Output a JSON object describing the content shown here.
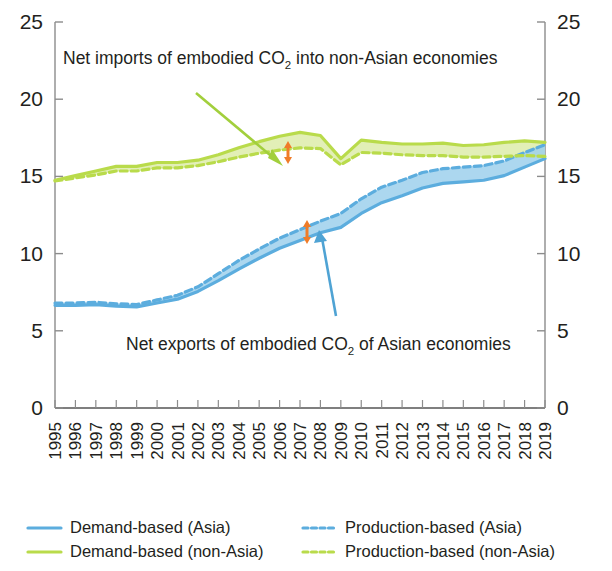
{
  "chart_data": {
    "type": "line",
    "title": "",
    "subtitle": "",
    "xlabel": "",
    "ylabel": "",
    "ylim": [
      0,
      25
    ],
    "yticks": [
      0,
      5,
      10,
      15,
      20,
      25
    ],
    "dual_y_axis": true,
    "grid": false,
    "legend_position": "bottom",
    "categories": [
      "1995",
      "1996",
      "1997",
      "1998",
      "1999",
      "2000",
      "2001",
      "2002",
      "2003",
      "2004",
      "2005",
      "2006",
      "2007",
      "2008",
      "2009",
      "2010",
      "2011",
      "2012",
      "2013",
      "2014",
      "2015",
      "2016",
      "2017",
      "2018",
      "2019"
    ],
    "series": [
      {
        "name": "Demand-based (Asia)",
        "style": "solid",
        "color": "#5cadde",
        "values": [
          6.65,
          6.65,
          6.7,
          6.6,
          6.55,
          6.8,
          7.05,
          7.55,
          8.25,
          9.0,
          9.7,
          10.35,
          10.85,
          11.35,
          11.7,
          12.6,
          13.3,
          13.75,
          14.25,
          14.55,
          14.65,
          14.75,
          15.05,
          15.6,
          16.15
        ]
      },
      {
        "name": "Production-based (Asia)",
        "style": "dashed",
        "color": "#5cadde",
        "values": [
          6.8,
          6.8,
          6.85,
          6.75,
          6.7,
          7.0,
          7.3,
          7.85,
          8.7,
          9.55,
          10.3,
          11.0,
          11.55,
          12.1,
          12.6,
          13.55,
          14.3,
          14.75,
          15.25,
          15.5,
          15.6,
          15.7,
          16.0,
          16.55,
          17.05
        ]
      },
      {
        "name": "Demand-based (non-Asia)",
        "style": "solid",
        "color": "#b9db4b",
        "values": [
          14.75,
          15.05,
          15.35,
          15.65,
          15.65,
          15.9,
          15.9,
          16.05,
          16.4,
          16.85,
          17.25,
          17.6,
          17.85,
          17.65,
          16.15,
          17.35,
          17.2,
          17.1,
          17.1,
          17.15,
          17.0,
          17.05,
          17.2,
          17.3,
          17.2
        ]
      },
      {
        "name": "Production-based (non-Asia)",
        "style": "dashed",
        "color": "#b9db4b",
        "values": [
          14.7,
          14.9,
          15.1,
          15.35,
          15.35,
          15.55,
          15.55,
          15.7,
          15.95,
          16.25,
          16.5,
          16.7,
          16.85,
          16.8,
          15.75,
          16.55,
          16.5,
          16.4,
          16.35,
          16.35,
          16.25,
          16.25,
          16.3,
          16.35,
          16.3
        ]
      }
    ],
    "annotations": [
      {
        "id": "net-imports-label",
        "text_prefix": "Net imports of embodied CO",
        "text_sub": "2",
        "text_suffix": " into non-Asian economies",
        "arrow_color": "#a2cf3c",
        "marker": "double-arrow",
        "marker_color": "#f07c28",
        "marker_year": "2006"
      },
      {
        "id": "net-exports-label",
        "text_prefix": "Net exports of embodied CO",
        "text_sub": "2",
        "text_suffix": " of Asian economies",
        "arrow_color": "#4fa3d4",
        "marker": "double-arrow",
        "marker_color": "#f07c28",
        "marker_year": "2007"
      }
    ]
  },
  "axes": {
    "left_labels": [
      "25",
      "20",
      "15",
      "10",
      "5",
      "0"
    ],
    "right_labels": [
      "25",
      "20",
      "15",
      "10",
      "5",
      "0"
    ]
  },
  "legend": {
    "items": [
      {
        "label": "Demand-based (Asia)",
        "color": "#5cadde",
        "style": "solid"
      },
      {
        "label": "Production-based (Asia)",
        "color": "#5cadde",
        "style": "dashed"
      },
      {
        "label": "Demand-based (non-Asia)",
        "color": "#b9db4b",
        "style": "solid"
      },
      {
        "label": "Production-based (non-Asia)",
        "color": "#b9db4b",
        "style": "dashed"
      }
    ]
  },
  "colors": {
    "blue": "#5cadde",
    "blue_fill": "#9ed0ec",
    "green": "#b9db4b",
    "green_fill": "#ddecaa",
    "orange": "#f07c28",
    "axis": "#8c8c8c",
    "text": "#231f20"
  }
}
